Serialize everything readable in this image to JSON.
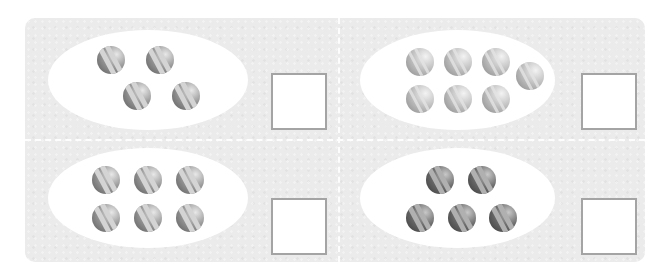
{
  "worksheet": {
    "background_color": "#ebebeb",
    "ellipse_color": "#ffffff",
    "answer_box_border_color": "#a4a4a4",
    "panels": [
      {
        "id": "top-left",
        "ball_count": 4,
        "ball_style": "medium",
        "balls": [
          [
            111,
            60
          ],
          [
            160,
            60
          ],
          [
            137,
            96
          ],
          [
            186,
            96
          ]
        ],
        "answer": ""
      },
      {
        "id": "top-right",
        "ball_count": 7,
        "ball_style": "light",
        "balls": [
          [
            420,
            62
          ],
          [
            458,
            62
          ],
          [
            496,
            62
          ],
          [
            530,
            76
          ],
          [
            420,
            99
          ],
          [
            458,
            99
          ],
          [
            496,
            99
          ]
        ],
        "answer": ""
      },
      {
        "id": "bottom-left",
        "ball_count": 6,
        "ball_style": "medium",
        "balls": [
          [
            106,
            180
          ],
          [
            148,
            180
          ],
          [
            190,
            180
          ],
          [
            106,
            218
          ],
          [
            148,
            218
          ],
          [
            190,
            218
          ]
        ],
        "answer": ""
      },
      {
        "id": "bottom-right",
        "ball_count": 5,
        "ball_style": "dark",
        "balls": [
          [
            440,
            180
          ],
          [
            482,
            180
          ],
          [
            420,
            218
          ],
          [
            462,
            218
          ],
          [
            503,
            218
          ]
        ],
        "answer": ""
      }
    ]
  }
}
